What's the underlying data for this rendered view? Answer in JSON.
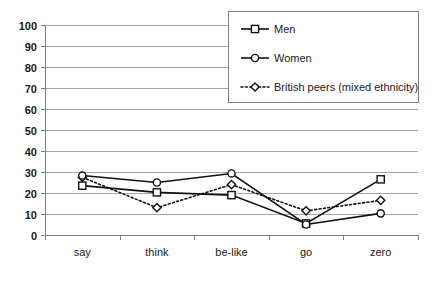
{
  "chart_data": {
    "type": "line",
    "title": "",
    "subtitle": "",
    "xlabel": "",
    "ylabel": "",
    "categories": [
      "say",
      "think",
      "be-like",
      "go",
      "zero"
    ],
    "ylim": [
      0,
      100
    ],
    "ytick_labels": [
      "100",
      "90",
      "80",
      "70",
      "60",
      "50",
      "40",
      "30",
      "20",
      "10",
      "0"
    ],
    "yticks": [
      100,
      90,
      80,
      70,
      60,
      50,
      40,
      30,
      20,
      10,
      0
    ],
    "grid": "horizontal",
    "legend_position": "top-right",
    "series": [
      {
        "name": "Men",
        "marker": "square",
        "line_style": "solid",
        "color": "#111111",
        "values": [
          23.5,
          20.3,
          19.0,
          5.5,
          26.5
        ]
      },
      {
        "name": "Women",
        "marker": "circle",
        "line_style": "solid",
        "color": "#111111",
        "values": [
          28.3,
          25.0,
          29.3,
          5.0,
          10.3
        ]
      },
      {
        "name": "British peers (mixed ethnicity)",
        "marker": "diamond",
        "line_style": "dotted",
        "color": "#111111",
        "values": [
          27.5,
          13.0,
          24.0,
          11.5,
          16.5
        ]
      }
    ]
  },
  "legend": {
    "items": [
      {
        "label": "Men",
        "marker": "square-marker-icon",
        "line_style": "solid"
      },
      {
        "label": "Women",
        "marker": "circle-marker-icon",
        "line_style": "solid"
      },
      {
        "label": "British peers (mixed ethnicity)",
        "marker": "diamond-marker-icon",
        "line_style": "dotted"
      }
    ]
  }
}
